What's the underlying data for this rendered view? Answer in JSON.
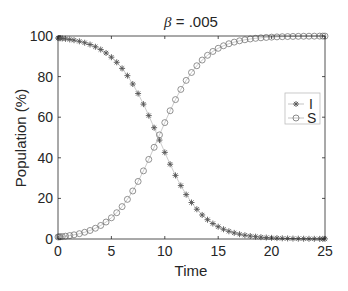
{
  "chart_data": {
    "type": "line",
    "title": "β = .005",
    "title_symbol": "β",
    "title_value": " = .005",
    "xlabel": "Time",
    "ylabel": "Population (%)",
    "xlim": [
      0,
      25
    ],
    "ylim": [
      0,
      100
    ],
    "xticks": [
      0,
      5,
      10,
      15,
      20,
      25
    ],
    "yticks": [
      0,
      20,
      40,
      60,
      80,
      100
    ],
    "grid": false,
    "legend_position": "right",
    "x": [
      0,
      0.1,
      0.2,
      0.4,
      0.7,
      1.1,
      1.5,
      2.0,
      2.5,
      3.0,
      3.5,
      4.0,
      4.5,
      5.0,
      5.5,
      6.0,
      6.5,
      7.0,
      7.5,
      8.0,
      8.5,
      9.0,
      9.5,
      10.0,
      10.5,
      11.0,
      11.5,
      12.0,
      12.5,
      13.0,
      13.5,
      14.0,
      14.5,
      15.0,
      15.5,
      16.0,
      16.5,
      17.0,
      17.5,
      18.0,
      18.5,
      19.0,
      19.5,
      20.0,
      20.5,
      21.0,
      21.5,
      22.0,
      22.5,
      23.0,
      23.5,
      24.0,
      24.5,
      24.8,
      25.0
    ],
    "series": [
      {
        "name": "I",
        "marker": "asterisk",
        "color": "#555555",
        "values": [
          99.0,
          98.95,
          98.9,
          98.79,
          98.6,
          98.3,
          97.94,
          97.38,
          96.68,
          95.8,
          94.7,
          93.33,
          91.64,
          89.56,
          87.05,
          84.04,
          80.47,
          76.35,
          71.65,
          66.44,
          60.79,
          54.83,
          48.72,
          42.67,
          36.83,
          31.33,
          26.32,
          21.87,
          17.98,
          14.65,
          11.84,
          9.5,
          7.61,
          6.06,
          4.81,
          3.81,
          3.01,
          2.37,
          1.86,
          1.47,
          1.15,
          0.9,
          0.71,
          0.56,
          0.44,
          0.34,
          0.27,
          0.21,
          0.16,
          0.13,
          0.1,
          0.08,
          0.06,
          0.05,
          0.05
        ]
      },
      {
        "name": "S",
        "marker": "circle",
        "color": "#777777",
        "values": [
          1.0,
          1.05,
          1.1,
          1.21,
          1.4,
          1.7,
          2.06,
          2.62,
          3.32,
          4.2,
          5.3,
          6.67,
          8.36,
          10.44,
          12.95,
          15.96,
          19.53,
          23.65,
          28.35,
          33.56,
          39.21,
          45.17,
          51.28,
          57.33,
          63.17,
          68.67,
          73.68,
          78.13,
          82.02,
          85.35,
          88.16,
          90.5,
          92.39,
          93.94,
          95.19,
          96.19,
          96.99,
          97.63,
          98.14,
          98.53,
          98.85,
          99.1,
          99.29,
          99.44,
          99.56,
          99.66,
          99.73,
          99.79,
          99.84,
          99.87,
          99.9,
          99.92,
          99.94,
          99.95,
          99.95
        ]
      }
    ]
  }
}
